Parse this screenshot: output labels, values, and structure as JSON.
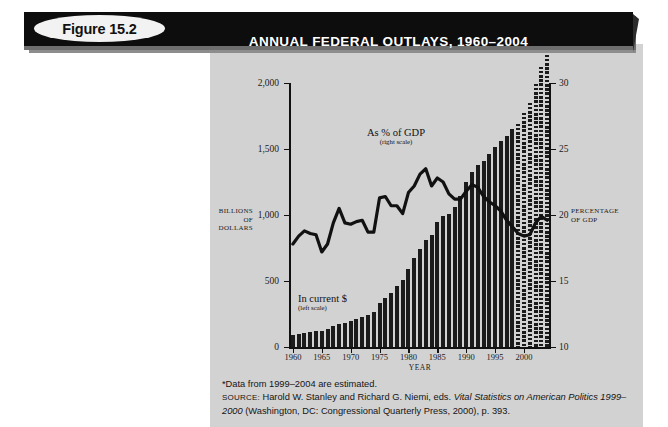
{
  "banner": {
    "figure_label": "Figure 15.2",
    "title": "ANNUAL FEDERAL OUTLAYS, 1960–2004"
  },
  "footnotes": {
    "note": "*Data from 1999–2004 are estimated.",
    "source_label": "SOURCE:",
    "source_part1": " Harold W. Stanley and Richard G. Niemi, eds. ",
    "source_italic1": "Vital Statistics on American Politics 1999–2000",
    "source_part2": " (Washington, DC: Congressional Quarterly Press, 2000), p. 393."
  },
  "chart_data": {
    "type": "bar",
    "title": "ANNUAL FEDERAL OUTLAYS, 1960–2004",
    "xlabel": "YEAR",
    "ylabel": "BILLIONS OF DOLLARS",
    "ylabel_right": "PERCENTAGE OF GDP",
    "ylim": [
      0,
      2000
    ],
    "ylim_right": [
      10,
      30
    ],
    "xlim": [
      1960,
      2004
    ],
    "grid": false,
    "legend_position": "inline-annotations",
    "y_ticks": [
      "0",
      "500",
      "1,000",
      "1,500",
      "2,000"
    ],
    "y_tick_values": [
      0,
      500,
      1000,
      1500,
      2000
    ],
    "y_ticks_right": [
      "10",
      "15",
      "20",
      "25",
      "30"
    ],
    "y_tick_values_right": [
      10,
      15,
      20,
      25,
      30
    ],
    "x_ticks": [
      "1960",
      "1965",
      "1970",
      "1975",
      "1980",
      "1985",
      "1990",
      "1995",
      "2000"
    ],
    "x_tick_values": [
      1960,
      1965,
      1970,
      1975,
      1980,
      1985,
      1990,
      1995,
      2000
    ],
    "annotations": [
      {
        "name": "gdp-line-label",
        "main": "As % of GDP",
        "sub": "(right scale)"
      },
      {
        "name": "outlays-bar-label",
        "main": "In current $",
        "sub": "(left scale)"
      }
    ],
    "categories": [
      1960,
      1961,
      1962,
      1963,
      1964,
      1965,
      1966,
      1967,
      1968,
      1969,
      1970,
      1971,
      1972,
      1973,
      1974,
      1975,
      1976,
      1977,
      1978,
      1979,
      1980,
      1981,
      1982,
      1983,
      1984,
      1985,
      1986,
      1987,
      1988,
      1989,
      1990,
      1991,
      1992,
      1993,
      1994,
      1995,
      1996,
      1997,
      1998,
      1999,
      2000,
      2001,
      2002,
      2003,
      2004
    ],
    "series": [
      {
        "name": "In current $",
        "axis": "left",
        "unit": "billions of dollars",
        "values": [
          92,
          98,
          107,
          111,
          119,
          118,
          135,
          157,
          178,
          184,
          196,
          210,
          231,
          246,
          269,
          332,
          372,
          409,
          459,
          504,
          591,
          678,
          746,
          808,
          852,
          946,
          990,
          1004,
          1064,
          1143,
          1253,
          1324,
          1382,
          1409,
          1462,
          1516,
          1561,
          1601,
          1653,
          1703,
          1789,
          1864,
          2011,
          2140,
          2229
        ],
        "estimated_from": 1999
      },
      {
        "name": "As % of GDP",
        "axis": "right",
        "unit": "percent of GDP",
        "values": [
          17.8,
          18.4,
          18.8,
          18.6,
          18.5,
          17.2,
          17.8,
          19.4,
          20.5,
          19.4,
          19.3,
          19.5,
          19.6,
          18.7,
          18.7,
          21.3,
          21.4,
          20.7,
          20.7,
          20.1,
          21.7,
          22.2,
          23.1,
          23.5,
          22.2,
          22.8,
          22.5,
          21.6,
          21.2,
          21.2,
          21.8,
          22.3,
          22.1,
          21.4,
          21.0,
          20.7,
          20.3,
          19.6,
          19.1,
          18.6,
          18.4,
          18.5,
          19.4,
          19.9,
          19.6
        ],
        "estimated_from": 1999
      }
    ]
  },
  "colors": {
    "panel_background": "#d2d2d2",
    "banner_background": "#0d0d0d",
    "banner_text": "#ffffff",
    "bar_fill": "#1b1b1b",
    "line_stroke": "#111111",
    "pill_background": "#f2f2f2"
  }
}
